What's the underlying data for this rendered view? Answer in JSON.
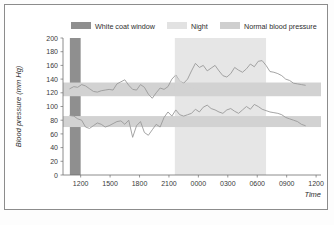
{
  "chart_data": {
    "type": "line",
    "title": "",
    "xlabel": "Time",
    "ylabel": "Blood pressure (mm Hg)",
    "ylim": [
      0,
      200
    ],
    "ytick_step": 20,
    "yticks": [
      "0",
      "20",
      "40",
      "60",
      "80",
      "100",
      "120",
      "140",
      "160",
      "180",
      "200"
    ],
    "xticks": [
      "1200",
      "1500",
      "1800",
      "2100",
      "0000",
      "0300",
      "0600",
      "0900",
      "1200"
    ],
    "xtick_hours": [
      12,
      15,
      18,
      21,
      24,
      27,
      30,
      33,
      36
    ],
    "xlim_hours": [
      10.2,
      36.5
    ],
    "grid": false,
    "legend_position": "top",
    "legend": [
      {
        "label": "White coat window",
        "color": "#8f8f8f"
      },
      {
        "label": "Night",
        "color": "#e2e2e2"
      },
      {
        "label": "Normal blood pressure",
        "color": "#cfcfcf"
      }
    ],
    "bands": [
      {
        "name": "white-coat-window",
        "orientation": "vertical",
        "x_start_hours": 10.9,
        "x_end_hours": 12.0,
        "color": "#8f8f8f"
      },
      {
        "name": "night",
        "orientation": "vertical",
        "x_start_hours": 21.6,
        "x_end_hours": 30.9,
        "color": "#e6e6e6"
      },
      {
        "name": "normal-systolic",
        "orientation": "horizontal",
        "y_low": 115,
        "y_high": 135,
        "color": "#d2d2d2"
      },
      {
        "name": "normal-diastolic",
        "orientation": "horizontal",
        "y_low": 70,
        "y_high": 86,
        "color": "#d2d2d2"
      }
    ],
    "series": [
      {
        "name": "Systolic blood pressure",
        "color": "#9a9a9a",
        "x": [
          10.9,
          11.3,
          11.7,
          12.1,
          12.5,
          12.9,
          13.3,
          13.7,
          14.1,
          14.5,
          14.9,
          15.3,
          15.7,
          16.1,
          16.5,
          16.9,
          17.3,
          17.7,
          18.1,
          18.5,
          18.9,
          19.3,
          19.7,
          20.1,
          20.5,
          20.9,
          21.3,
          21.7,
          22.1,
          22.5,
          22.9,
          23.3,
          23.7,
          24.1,
          24.5,
          24.9,
          25.3,
          25.7,
          26.1,
          26.5,
          26.9,
          27.3,
          27.7,
          28.1,
          28.5,
          28.9,
          29.3,
          29.7,
          30.1,
          30.5,
          30.9,
          31.3,
          31.7,
          32.1,
          32.5,
          32.9,
          33.3,
          33.7,
          34.1,
          34.5,
          34.9
        ],
        "values": [
          126,
          129,
          128,
          132,
          130,
          126,
          122,
          121,
          123,
          124,
          125,
          124,
          133,
          136,
          139,
          131,
          125,
          124,
          132,
          128,
          118,
          112,
          120,
          127,
          125,
          129,
          140,
          146,
          137,
          134,
          140,
          152,
          163,
          157,
          160,
          152,
          156,
          160,
          152,
          145,
          143,
          148,
          157,
          153,
          150,
          155,
          162,
          158,
          166,
          167,
          160,
          151,
          150,
          148,
          145,
          140,
          138,
          134,
          133,
          132,
          131
        ]
      },
      {
        "name": "Diastolic blood pressure",
        "color": "#9a9a9a",
        "x": [
          10.9,
          11.3,
          11.7,
          12.1,
          12.5,
          12.9,
          13.3,
          13.7,
          14.1,
          14.5,
          14.9,
          15.3,
          15.7,
          16.1,
          16.5,
          16.9,
          17.3,
          17.7,
          18.1,
          18.5,
          18.9,
          19.3,
          19.7,
          20.1,
          20.5,
          20.9,
          21.3,
          21.7,
          22.1,
          22.5,
          22.9,
          23.3,
          23.7,
          24.1,
          24.5,
          24.9,
          25.3,
          25.7,
          26.1,
          26.5,
          26.9,
          27.3,
          27.7,
          28.1,
          28.5,
          28.9,
          29.3,
          29.7,
          30.1,
          30.5,
          30.9,
          31.3,
          31.7,
          32.1,
          32.5,
          32.9,
          33.3,
          33.7,
          34.1,
          34.5,
          34.9
        ],
        "values": [
          87,
          86,
          82,
          80,
          70,
          68,
          72,
          76,
          74,
          70,
          72,
          75,
          78,
          79,
          74,
          80,
          55,
          72,
          78,
          62,
          58,
          66,
          74,
          70,
          84,
          92,
          86,
          95,
          88,
          86,
          88,
          90,
          96,
          92,
          99,
          102,
          97,
          95,
          92,
          90,
          95,
          97,
          93,
          90,
          95,
          100,
          96,
          103,
          100,
          96,
          94,
          92,
          91,
          90,
          88,
          84,
          82,
          80,
          78,
          74,
          72
        ]
      },
      {
        "name": "white-coat-decay-systolic",
        "color": "#d2d2d2",
        "is_fill": true,
        "x": [
          21.6,
          22.0,
          22.6,
          23.2,
          23.9,
          25.2
        ],
        "values": [
          147,
          140,
          132,
          127,
          124,
          122
        ]
      }
    ]
  }
}
